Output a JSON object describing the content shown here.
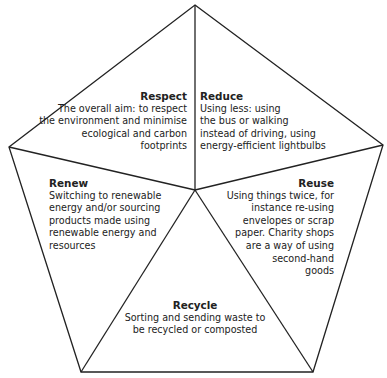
{
  "diagram": {
    "type": "pentagon",
    "line_color": "#222222",
    "sections": [
      {
        "id": "respect",
        "title": "Respect",
        "text": "The overall aim: to respect\nthe environment and minimise\necological and carbon\nfootprints"
      },
      {
        "id": "reduce",
        "title": "Reduce",
        "text": "Using less: using\nthe bus or walking\ninstead of driving, using\nenergy-efficient lightbulbs"
      },
      {
        "id": "renew",
        "title": "Renew",
        "text": "Switching to renewable\nenergy and/or sourcing\nproducts made using\nrenewable energy and\nresources"
      },
      {
        "id": "reuse",
        "title": "Reuse",
        "text": "Using things twice, for\ninstance re-using\nenvelopes or scrap\npaper. Charity shops\nare a way of using\nsecond-hand\ngoods"
      },
      {
        "id": "recycle",
        "title": "Recycle",
        "text": "Sorting and sending waste to\nbe recycled or composted"
      }
    ]
  }
}
